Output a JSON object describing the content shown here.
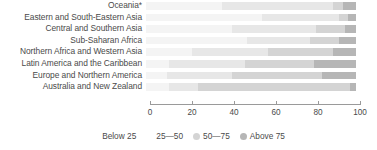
{
  "chart_data": {
    "type": "bar",
    "subtype": "stacked-horizontal-100",
    "title": "",
    "subtitle": "",
    "xlabel": "",
    "ylabel": "",
    "xlim": [
      0,
      100
    ],
    "grid": false,
    "legend_position": "bottom",
    "axis": {
      "ticks": [
        0,
        20,
        40,
        60,
        80,
        100
      ],
      "tick_labels": [
        "0",
        "20",
        "40",
        "60",
        "80",
        "100"
      ]
    },
    "categories": [
      "Oceania*",
      "Eastern and South-Eastern Asia",
      "Central and Southern Asia",
      "Sub-Saharan Africa",
      "Northern Africa and Western Asia",
      "Latin America and the Caribbean",
      "Europe and Northern America",
      "Australia and New Zealand"
    ],
    "series": [
      {
        "name": "Below 25",
        "color": "#f4f4f4",
        "values": [
          36,
          55,
          41,
          48,
          22,
          11,
          10,
          11
        ]
      },
      {
        "name": "25—50",
        "color": "#e7e7e7",
        "values": [
          53,
          37,
          40,
          30,
          36,
          36,
          31,
          14
        ]
      },
      {
        "name": "50—75",
        "color": "#d4d4d4",
        "values": [
          5,
          4,
          14,
          14,
          31,
          33,
          43,
          72
        ]
      },
      {
        "name": "Above 75",
        "color": "#b6b6b6",
        "values": [
          6,
          4,
          5,
          8,
          11,
          20,
          16,
          3
        ]
      }
    ],
    "legend": [
      {
        "label": "Below 25",
        "color": "#f4f4f4",
        "swatch_visible": false
      },
      {
        "label": "25—50",
        "color": "#e7e7e7",
        "swatch_visible": false
      },
      {
        "label": "50—75",
        "color": "#d4d4d4",
        "swatch_visible": true
      },
      {
        "label": "Above 75",
        "color": "#b6b6b6",
        "swatch_visible": true
      }
    ]
  }
}
